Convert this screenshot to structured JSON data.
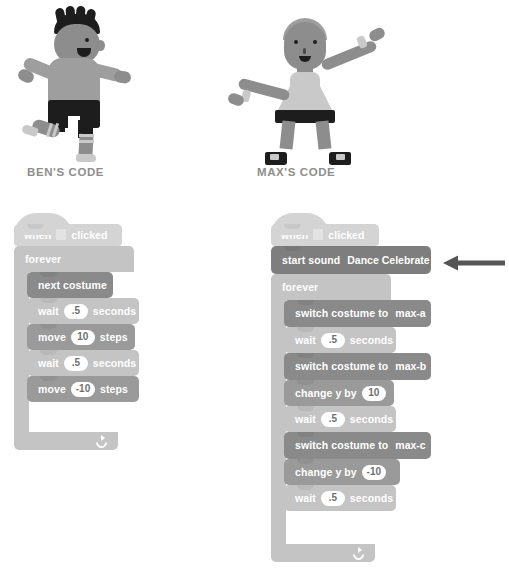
{
  "captions": {
    "ben": "BEN'S CODE",
    "max": "MAX'S CODE"
  },
  "illustrations": [
    {
      "name": "ben-character",
      "description": "running boy with spiky black hair, gray shirt, black shorts, striped socks"
    },
    {
      "name": "max-character",
      "description": "dancing figure with arms outstretched, light dress, dark belt, black shoes"
    }
  ],
  "ben_script": {
    "name": "ben-code-stack",
    "hat": {
      "word_when": "when",
      "flag_icon": "green-flag-icon",
      "word_clicked": "clicked"
    },
    "forever": {
      "label": "forever",
      "loop_icon": "loop-arrow-icon"
    },
    "blocks": [
      {
        "type": "looks",
        "name": "next-costume-block",
        "text": "next costume"
      },
      {
        "type": "control",
        "name": "wait-block-1",
        "pre": "wait",
        "value": ".5",
        "post": "seconds"
      },
      {
        "type": "motion",
        "name": "move-block-1",
        "pre": "move",
        "value": "10",
        "post": "steps"
      },
      {
        "type": "control",
        "name": "wait-block-2",
        "pre": "wait",
        "value": ".5",
        "post": "seconds"
      },
      {
        "type": "motion",
        "name": "move-block-2",
        "pre": "move",
        "value": "-10",
        "post": "steps"
      }
    ]
  },
  "max_script": {
    "name": "max-code-stack",
    "hat": {
      "word_when": "when",
      "flag_icon": "green-flag-icon",
      "word_clicked": "clicked"
    },
    "start_sound": {
      "name": "start-sound-block",
      "label": "start sound",
      "value": "Dance Celebrate",
      "caret_icon": "chevron-down-icon"
    },
    "forever": {
      "label": "forever",
      "loop_icon": "loop-arrow-icon"
    },
    "blocks": [
      {
        "type": "looks",
        "name": "switch-costume-block-1",
        "pre": "switch costume to",
        "value": "max-a"
      },
      {
        "type": "control",
        "name": "wait-block-1",
        "pre": "wait",
        "value": ".5",
        "post": "seconds"
      },
      {
        "type": "looks",
        "name": "switch-costume-block-2",
        "pre": "switch costume to",
        "value": "max-b"
      },
      {
        "type": "motion",
        "name": "change-y-block-1",
        "pre": "change y by",
        "value": "10",
        "post": ""
      },
      {
        "type": "control",
        "name": "wait-block-2",
        "pre": "wait",
        "value": ".5",
        "post": "seconds"
      },
      {
        "type": "looks",
        "name": "switch-costume-block-3",
        "pre": "switch costume to",
        "value": "max-c"
      },
      {
        "type": "motion",
        "name": "change-y-block-2",
        "pre": "change y by",
        "value": "-10",
        "post": ""
      },
      {
        "type": "control",
        "name": "wait-block-3",
        "pre": "wait",
        "value": ".5",
        "post": "seconds"
      }
    ]
  },
  "annotation": {
    "arrow_icon": "left-arrow-icon",
    "points_at": "start-sound-block"
  },
  "colors": {
    "events_block": "#d4d4d4",
    "control_block": "#c4c4c4",
    "looks_block": "#8a8a8a",
    "sound_block": "#7e7e7e",
    "motion_block": "#9a9a9a",
    "caption_text": "#8e8e8e",
    "block_text": "#ffffff",
    "input_oval": "#ffffff",
    "arrow": "#555555"
  }
}
